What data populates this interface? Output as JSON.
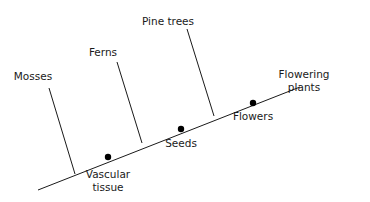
{
  "diagram": {
    "type": "cladogram",
    "colors": {
      "line": "#1a1a1a",
      "dot": "#000000",
      "background": "#ffffff"
    },
    "main_axis": {
      "x1": 38,
      "y1": 190,
      "x2": 300,
      "y2": 87
    },
    "branches": [
      {
        "label": "Mosses",
        "x1": 49,
        "y1": 88,
        "x2": 75,
        "y2": 174,
        "lx": 33,
        "ly": 80
      },
      {
        "label": "Ferns",
        "x1": 117,
        "y1": 62,
        "x2": 142,
        "y2": 143,
        "lx": 103,
        "ly": 56
      },
      {
        "label": "Pine trees",
        "x1": 187,
        "y1": 29,
        "x2": 214,
        "y2": 116,
        "lx": 168,
        "ly": 25
      }
    ],
    "terminal": {
      "line1": "Flowering",
      "line2": "plants",
      "lx": 304,
      "ly1": 78,
      "ly2": 91
    },
    "traits": [
      {
        "line1": "Vascular",
        "line2": "tissue",
        "cx": 108,
        "cy": 157,
        "lx": 108,
        "ly1": 178,
        "ly2": 191
      },
      {
        "line1": "Seeds",
        "line2": "",
        "cx": 181,
        "cy": 129,
        "lx": 181,
        "ly1": 147,
        "ly2": 0
      },
      {
        "line1": "Flowers",
        "line2": "",
        "cx": 253,
        "cy": 103,
        "lx": 253,
        "ly1": 120,
        "ly2": 0
      }
    ]
  }
}
